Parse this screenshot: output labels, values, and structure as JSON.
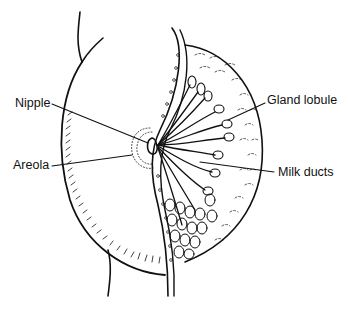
{
  "figure": {
    "colors": {
      "ink": "#111111",
      "background": "#ffffff"
    }
  },
  "labels": {
    "nipple": "Nipple",
    "areola": "Areola",
    "gland_lobule": "Gland lobule",
    "milk_ducts": "Milk ducts"
  }
}
